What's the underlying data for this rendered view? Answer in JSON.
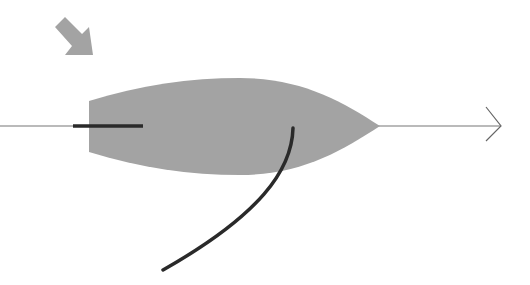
{
  "diagram": {
    "type": "sailing-boat-top-view",
    "colors": {
      "background": "#ffffff",
      "hull": "#a3a3a3",
      "wind_arrow": "#a3a3a3",
      "heading_line": "#777777",
      "tiller": "#2a2a2a",
      "sail": "#2a2a2a"
    },
    "elements": {
      "wind_arrow": {
        "direction": "south-east"
      },
      "hull": {
        "label": ""
      },
      "heading_line": {
        "direction": "right"
      },
      "tiller": {},
      "sail": {}
    }
  }
}
